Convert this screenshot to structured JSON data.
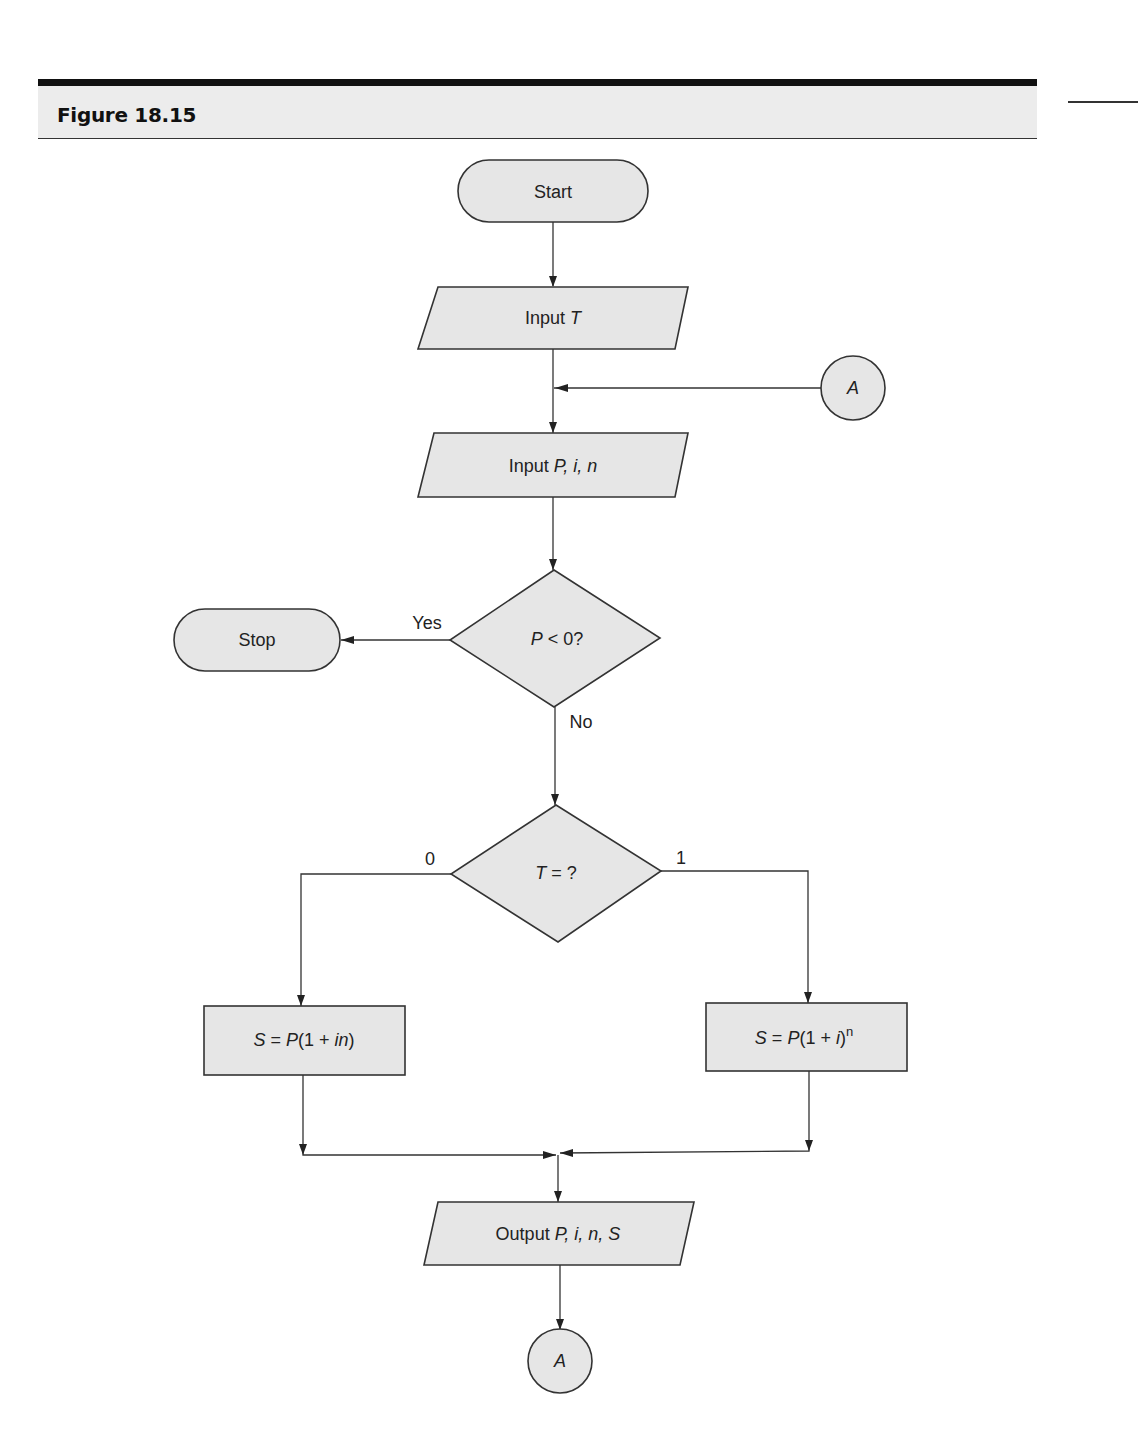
{
  "figure": {
    "title": "Figure 18.15"
  },
  "flowchart": {
    "nodes": {
      "start": {
        "type": "terminal",
        "label": "Start"
      },
      "input_t": {
        "type": "io",
        "label_prefix": "Input ",
        "label_var": "T"
      },
      "connector_in": {
        "type": "connector",
        "label": "A"
      },
      "input_pin": {
        "type": "io",
        "label_prefix": "Input ",
        "label_vars": "P, i, n"
      },
      "decision_p": {
        "type": "decision",
        "label_var": "P",
        "label_rest": " < 0?"
      },
      "stop": {
        "type": "terminal",
        "label": "Stop"
      },
      "decision_t": {
        "type": "decision",
        "label_var": "T",
        "label_rest": " = ?"
      },
      "simple_interest": {
        "type": "process",
        "s": "S",
        "eq": " = ",
        "p": "P",
        "open": "(1 + ",
        "i": "i",
        "n": "n",
        "close": ")"
      },
      "compound_interest": {
        "type": "process",
        "s": "S",
        "eq": " = ",
        "p": "P",
        "open": "(1 + ",
        "i": "i",
        "close": ")",
        "exp": "n"
      },
      "output": {
        "type": "io",
        "label_prefix": "Output ",
        "label_vars": "P, i, n, S"
      },
      "connector_out": {
        "type": "connector",
        "label": "A"
      }
    },
    "edge_labels": {
      "yes": "Yes",
      "no": "No",
      "zero": "0",
      "one": "1"
    },
    "colors": {
      "shape_fill": "#e6e6e6",
      "stroke": "#333333",
      "header_band": "#ececec"
    }
  }
}
